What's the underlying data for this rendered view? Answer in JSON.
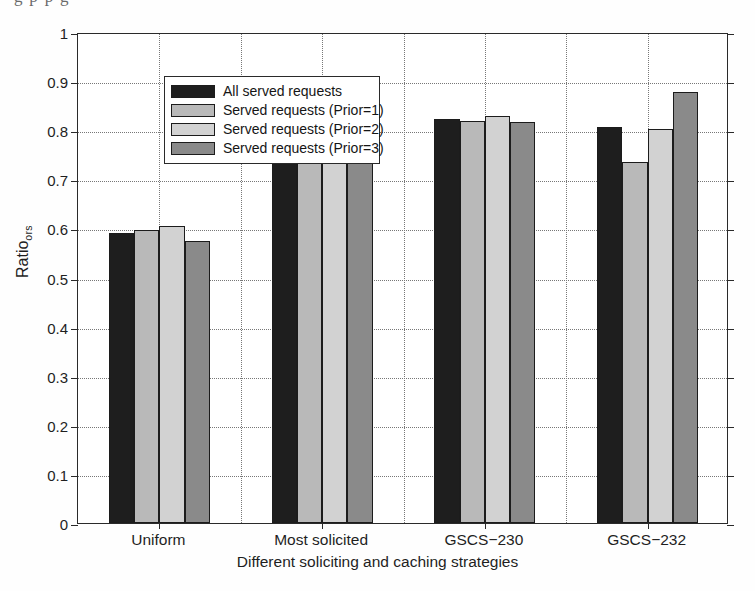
{
  "page": {
    "clipped_caption_above": "g   p             p                    g"
  },
  "chart_data": {
    "type": "bar",
    "title": "",
    "xlabel": "Different soliciting and caching strategies",
    "ylabel": "Ratio_ors",
    "ylabel_base": "Ratio",
    "ylabel_sub": "ors",
    "categories": [
      "Uniform",
      "Most solicited",
      "GSCS−230",
      "GSCS−232"
    ],
    "ylim": [
      0,
      1
    ],
    "ytick_labels": [
      "0",
      "0.1",
      "0.2",
      "0.3",
      "0.4",
      "0.5",
      "0.6",
      "0.7",
      "0.8",
      "0.9",
      "1"
    ],
    "ytick_values": [
      0,
      0.1,
      0.2,
      0.3,
      0.4,
      0.5,
      0.6,
      0.7,
      0.8,
      0.9,
      1
    ],
    "grid": "horizontal-and-vertical-dotted",
    "legend_position": "upper-left-inside",
    "series": [
      {
        "name": "All served requests",
        "color": "#1e1e1e",
        "values": [
          0.591,
          0.752,
          0.822,
          0.806
        ]
      },
      {
        "name": "Served requests (Prior=1)",
        "color": "#b9b9b9",
        "values": [
          0.597,
          0.751,
          0.819,
          0.735
        ]
      },
      {
        "name": "Served requests (Prior=2)",
        "color": "#d2d2d2",
        "values": [
          0.604,
          0.757,
          0.828,
          0.803
        ]
      },
      {
        "name": "Served requests (Prior=3)",
        "color": "#8a8a8a",
        "values": [
          0.574,
          0.748,
          0.816,
          0.878
        ]
      }
    ]
  },
  "legend": {
    "entries": [
      "All served requests",
      "Served requests (Prior=1)",
      "Served requests (Prior=2)",
      "Served requests (Prior=3)"
    ]
  },
  "axes": {
    "x_title": "Different soliciting and caching strategies",
    "y_title_base": "Ratio",
    "y_title_sub": "ors"
  }
}
